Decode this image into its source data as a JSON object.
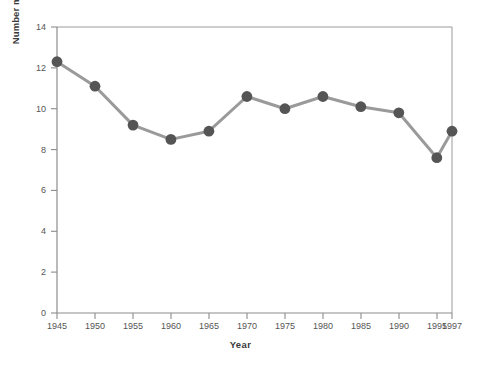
{
  "chart_data": {
    "type": "line",
    "title": "",
    "xlabel": "Year",
    "ylabel": "Number married (per 1,000 population)",
    "x": [
      1945,
      1950,
      1955,
      1960,
      1965,
      1970,
      1975,
      1980,
      1985,
      1990,
      1995,
      1997
    ],
    "values": [
      12.3,
      11.1,
      9.2,
      8.5,
      8.9,
      10.6,
      10.0,
      10.6,
      10.1,
      9.8,
      7.6,
      8.9
    ],
    "series": [
      {
        "name": "Number married",
        "values": [
          12.3,
          11.1,
          9.2,
          8.5,
          8.9,
          10.6,
          10.0,
          10.6,
          10.1,
          9.8,
          7.6,
          8.9
        ]
      }
    ],
    "xlim": [
      1945,
      1997
    ],
    "ylim": [
      0,
      14
    ],
    "ytick_labels": [
      "0",
      "2",
      "4",
      "6",
      "8",
      "10",
      "12",
      "14"
    ],
    "ytick_values": [
      0,
      2,
      4,
      6,
      8,
      10,
      12,
      14
    ],
    "xtick_labels": [
      "1945",
      "1950",
      "1955",
      "1960",
      "1965",
      "1970",
      "1975",
      "1980",
      "1985",
      "1990",
      "1995",
      "1997"
    ],
    "xtick_values": [
      1945,
      1950,
      1955,
      1960,
      1965,
      1970,
      1975,
      1980,
      1985,
      1990,
      1995,
      1997
    ],
    "grid": false,
    "legend": "none",
    "marker": "filled-circle",
    "colors": {
      "line": "#9a9a9a",
      "marker": "#555555",
      "axis": "#8c8c8c",
      "text": "#555555",
      "title": "#3a3a3a",
      "background": "#ffffff"
    }
  }
}
